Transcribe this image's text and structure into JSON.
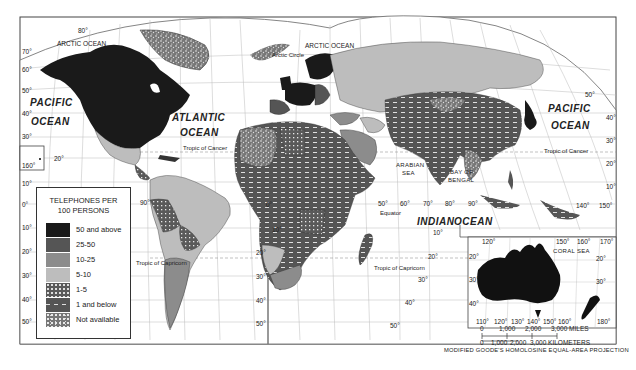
{
  "legend": {
    "title_line1": "TELEPHONES PER",
    "title_line2": "100 PERSONS",
    "items": [
      {
        "label": "50 and above",
        "fill": "#1a1a1a",
        "pattern": "solid"
      },
      {
        "label": "25-50",
        "fill": "#555555",
        "pattern": "solid"
      },
      {
        "label": "10-25",
        "fill": "#8c8c8c",
        "pattern": "solid"
      },
      {
        "label": "5-10",
        "fill": "#bdbdbd",
        "pattern": "solid"
      },
      {
        "label": "1-5",
        "fill": "#5a5a5a",
        "pattern": "dots"
      },
      {
        "label": "1 and below",
        "fill": "#555555",
        "pattern": "dashes"
      },
      {
        "label": "Not available",
        "fill": "#6e6e6e",
        "pattern": "speckle"
      }
    ]
  },
  "labels": {
    "arctic_ocean_west": "ARCTIC OCEAN",
    "arctic_ocean_east": "ARCTIC OCEAN",
    "arctic_circle": "Arctic Circle",
    "pacific_west_1": "PACIFIC",
    "pacific_west_2": "OCEAN",
    "atlantic_1": "ATLANTIC",
    "atlantic_2": "OCEAN",
    "pacific_east_1": "PACIFIC",
    "pacific_east_2": "OCEAN",
    "indian": "INDIAN",
    "indian_ocean": "OCEAN",
    "arabian_sea_1": "ARABIAN",
    "arabian_sea_2": "SEA",
    "bay_of_bengal_1": "BAY OF",
    "bay_of_bengal_2": "BENGAL",
    "coral_sea": "CORAL SEA",
    "tropic_cancer_w": "Tropic of Cancer",
    "tropic_cancer_e": "Tropic of Cancer",
    "tropic_capricorn_w": "Tropic of Capricorn",
    "tropic_capricorn_e": "Tropic of Capricorn",
    "equator": "Equator"
  },
  "degrees": {
    "left_lat": [
      "70°",
      "60°",
      "50°",
      "40°",
      "30°",
      "20°",
      "10°",
      "0°",
      "10°",
      "20°",
      "30°",
      "40°",
      "50°"
    ],
    "hawaii_lon": "160°",
    "hawaii_lat": "20°",
    "top_80": "80°",
    "sa_lon": "90°",
    "atl_lat": [
      "60°",
      "50°",
      "40°",
      "30°",
      "20°"
    ],
    "mid_lat": [
      "0°",
      "10°",
      "20°",
      "30°",
      "40°",
      "50°"
    ],
    "mid_lat2": [
      "10°",
      "20°",
      "30°",
      "40°",
      "50°"
    ],
    "io_lon": [
      "50°",
      "60°",
      "70°",
      "80°",
      "90°"
    ],
    "io_lat": [
      "10°",
      "20°",
      "30°",
      "40°",
      "50°"
    ],
    "east_lat": [
      "50°",
      "40°",
      "30°",
      "20°",
      "10°"
    ],
    "east_lon": [
      "140°",
      "150°"
    ],
    "aus_top": [
      "120°",
      "150°",
      "160°",
      "170°"
    ],
    "aus_bottom": [
      "110°",
      "120°",
      "130°",
      "140°",
      "150°",
      "160°",
      "170°",
      "180°"
    ],
    "aus_lat": [
      "20°",
      "30°",
      "40°"
    ],
    "aus_lat_r": [
      "20°",
      "30°"
    ]
  },
  "scale": {
    "miles": [
      "0",
      "1,000",
      "2,000",
      "3,000 MILES"
    ],
    "km": [
      "0",
      "1,000",
      "2,000",
      "3,000 KILOMETERS"
    ]
  },
  "projection": "MODIFIED GOODE'S HOMOLOSINE EQUAL-AREA PROJECTION"
}
